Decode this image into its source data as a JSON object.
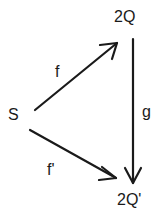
{
  "diagram": {
    "nodes": {
      "source": "S",
      "top": "2Q",
      "bottom": "2Q'"
    },
    "arrows": {
      "f": "f",
      "g": "g",
      "f_prime": "f'"
    },
    "colors": {
      "ink": "#1a1a1a",
      "background": "#ffffff"
    }
  }
}
